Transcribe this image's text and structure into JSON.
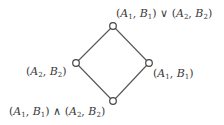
{
  "diagram": {
    "type": "hasse-diagram-lattice",
    "colors": {
      "edge": "#555555",
      "node_stroke": "#444444",
      "node_fill": "#ffffff",
      "text": "#3a3a3a"
    },
    "nodes": [
      {
        "id": "join",
        "x": 113,
        "y": 26,
        "label": "(A₁, B₁) ∨ (A₂, B₂)"
      },
      {
        "id": "a2b2",
        "x": 76,
        "y": 63,
        "label": "(A₂, B₂)"
      },
      {
        "id": "a1b1",
        "x": 149,
        "y": 63,
        "label": "(A₁, B₁)"
      },
      {
        "id": "meet",
        "x": 113,
        "y": 101,
        "label": "(A₁, B₁) ∧ (A₂, B₂)"
      }
    ],
    "edges": [
      {
        "from": "join",
        "to": "a2b2"
      },
      {
        "from": "join",
        "to": "a1b1"
      },
      {
        "from": "a2b2",
        "to": "meet"
      },
      {
        "from": "a1b1",
        "to": "meet"
      }
    ],
    "labels": {
      "top": {
        "p1": "(",
        "A": "A",
        "s1": "1",
        "c1": ", ",
        "B": "B",
        "s2": "1",
        "p2": ")",
        "op": " ∨ ",
        "p3": "(",
        "A2": "A",
        "s3": "2",
        "c2": ", ",
        "B2": "B",
        "s4": "2",
        "p4": ")"
      },
      "left": {
        "p1": "(",
        "A": "A",
        "s1": "2",
        "c1": ", ",
        "B": "B",
        "s2": "2",
        "p2": ")"
      },
      "right": {
        "p1": "(",
        "A": "A",
        "s1": "1",
        "c1": ", ",
        "B": "B",
        "s2": "1",
        "p2": ")"
      },
      "bottom": {
        "p1": "(",
        "A": "A",
        "s1": "1",
        "c1": ", ",
        "B": "B",
        "s2": "1",
        "p2": ")",
        "op": " ∧ ",
        "p3": "(",
        "A2": "A",
        "s3": "2",
        "c2": ", ",
        "B2": "B",
        "s4": "2",
        "p4": ")"
      }
    }
  }
}
